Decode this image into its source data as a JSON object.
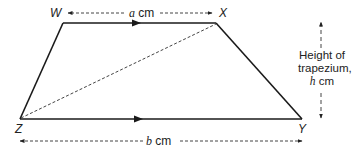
{
  "diagram": {
    "vertices": {
      "W": "W",
      "X": "X",
      "Y": "Y",
      "Z": "Z"
    },
    "top_side": {
      "var": "a",
      "unit": "cm"
    },
    "bottom_side": {
      "var": "b",
      "unit": "cm"
    },
    "height": {
      "line1": "Height of",
      "line2": "trapezium,",
      "var": "h",
      "unit": "cm"
    },
    "colors": {
      "line": "#1a1a1a",
      "dashed": "#444444"
    }
  }
}
